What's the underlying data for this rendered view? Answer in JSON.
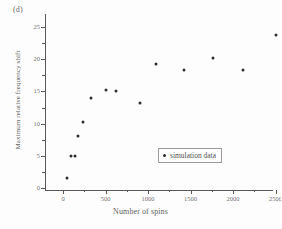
{
  "figure": {
    "panel_label": "(d)"
  },
  "legend": {
    "position": "inside-lower-right",
    "entries": [
      {
        "label": "simulation data",
        "marker": "filled-circle",
        "color": "#2e2e2e"
      }
    ]
  },
  "colors": {
    "marker": "#2e2e2e",
    "axis": "#585858",
    "text": "#5f5f5f",
    "background": "#fdfdfd"
  },
  "chart_data": {
    "type": "scatter",
    "title": "",
    "subtitle": "",
    "xlabel": "Number of spins",
    "ylabel": "Maximum relative frequency shift",
    "xlim": [
      0,
      2700
    ],
    "ylim": [
      0,
      26
    ],
    "xticks": [
      0,
      500,
      1000,
      1500,
      2000,
      2500
    ],
    "xtick_labels": [
      "0",
      "500",
      "1000",
      "1500",
      "2000",
      "2500"
    ],
    "yticks": [
      0,
      5,
      10,
      15,
      20,
      25
    ],
    "ytick_labels": [
      "0",
      "5",
      "10",
      "15",
      "20",
      "25"
    ],
    "x_minor_ticks": [
      250,
      750,
      1250,
      1750,
      2250,
      2500
    ],
    "y_minor_ticks": [
      2.5,
      7.5,
      12.5,
      17.5,
      22.5
    ],
    "grid": false,
    "annotations": [
      "(d)"
    ],
    "series": [
      {
        "name": "simulation data",
        "marker": "filled-circle",
        "color": "#2e2e2e",
        "points": [
          {
            "x": 50,
            "y": 1.5
          },
          {
            "x": 90,
            "y": 5.0
          },
          {
            "x": 140,
            "y": 5.0
          },
          {
            "x": 180,
            "y": 8.0
          },
          {
            "x": 230,
            "y": 10.2
          },
          {
            "x": 330,
            "y": 14.0
          },
          {
            "x": 500,
            "y": 15.2
          },
          {
            "x": 620,
            "y": 15.1
          },
          {
            "x": 900,
            "y": 13.2
          },
          {
            "x": 1090,
            "y": 19.3
          },
          {
            "x": 1420,
            "y": 18.3
          },
          {
            "x": 1760,
            "y": 20.2
          },
          {
            "x": 2120,
            "y": 18.3
          },
          {
            "x": 2500,
            "y": 23.8
          }
        ]
      }
    ]
  }
}
